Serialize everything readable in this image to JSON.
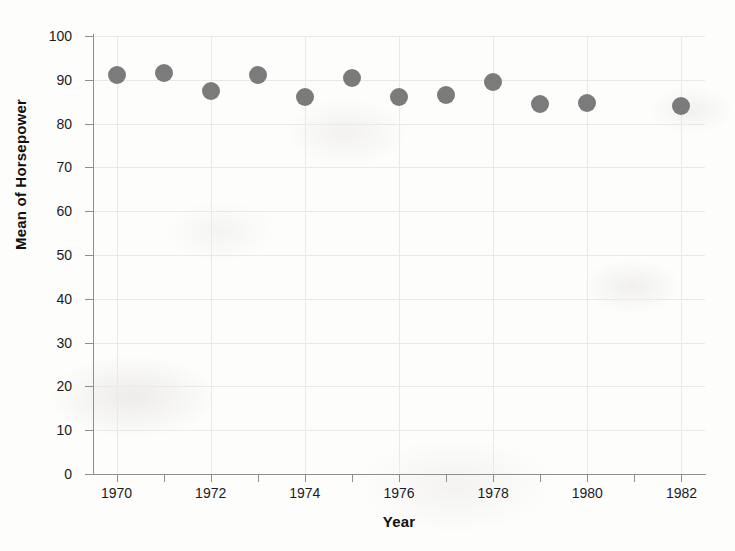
{
  "chart_data": {
    "type": "scatter",
    "title": "",
    "xlabel": "Year",
    "ylabel": "Mean of Horsepower",
    "xlim": [
      1969.5,
      1982.5
    ],
    "ylim": [
      0,
      100
    ],
    "grid": true,
    "legend": "none",
    "marker": {
      "shape": "circle",
      "color": "#7b7b7b",
      "size_px": 18
    },
    "x": [
      1970,
      1971,
      1972,
      1973,
      1974,
      1975,
      1976,
      1977,
      1978,
      1979,
      1980,
      1982
    ],
    "values": [
      91.0,
      91.5,
      87.5,
      91.0,
      86.0,
      90.5,
      86.0,
      86.5,
      89.5,
      84.5,
      84.8,
      84.0
    ],
    "points": [
      {
        "year": 1970,
        "mean_horsepower": 91.0
      },
      {
        "year": 1971,
        "mean_horsepower": 91.5
      },
      {
        "year": 1972,
        "mean_horsepower": 87.5
      },
      {
        "year": 1973,
        "mean_horsepower": 91.0
      },
      {
        "year": 1974,
        "mean_horsepower": 86.0
      },
      {
        "year": 1975,
        "mean_horsepower": 90.5
      },
      {
        "year": 1976,
        "mean_horsepower": 86.0
      },
      {
        "year": 1977,
        "mean_horsepower": 86.5
      },
      {
        "year": 1978,
        "mean_horsepower": 89.5
      },
      {
        "year": 1979,
        "mean_horsepower": 84.5
      },
      {
        "year": 1980,
        "mean_horsepower": 84.8
      },
      {
        "year": 1982,
        "mean_horsepower": 84.0
      }
    ],
    "y_ticks": [
      0,
      10,
      20,
      30,
      40,
      50,
      60,
      70,
      80,
      90,
      100
    ],
    "y_tick_labels": [
      "0",
      "10",
      "20",
      "30",
      "40",
      "50",
      "60",
      "70",
      "80",
      "90",
      "100"
    ],
    "x_ticks": [
      1970,
      1971,
      1972,
      1973,
      1974,
      1975,
      1976,
      1977,
      1978,
      1979,
      1980,
      1981,
      1982
    ],
    "x_tick_labels": [
      "1970",
      "",
      "1972",
      "",
      "1974",
      "",
      "1976",
      "",
      "1978",
      "",
      "1980",
      "",
      "1982"
    ],
    "colors": {
      "marker": "#7b7b7b",
      "axis": "#8e8e8e",
      "grid": "#e9e9e6",
      "text": "#1b1b1b",
      "background": "#fdfdfc"
    }
  }
}
